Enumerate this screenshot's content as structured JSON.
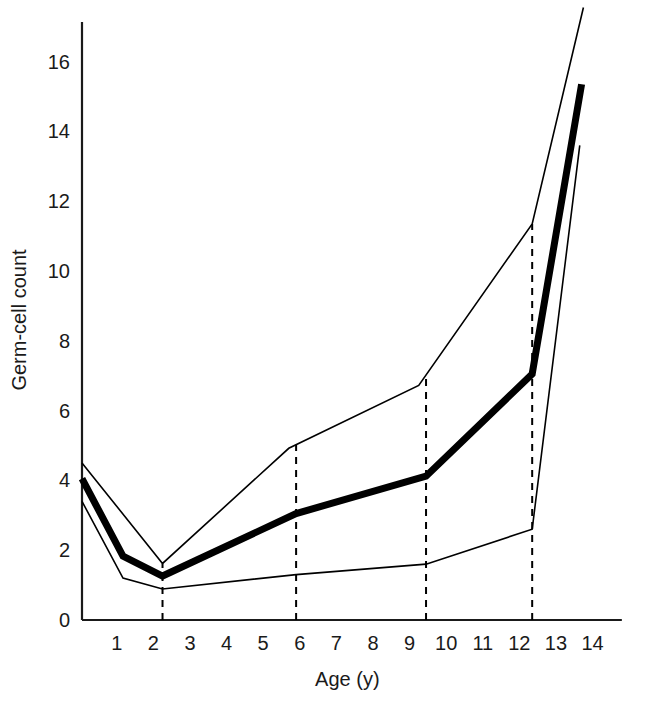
{
  "chart_data": {
    "type": "line",
    "title": "",
    "xlabel": "Age (y)",
    "ylabel": "Germ-cell count",
    "xlim": [
      0.05,
      14.6
    ],
    "ylim": [
      0,
      17.4
    ],
    "grid": false,
    "legend": null,
    "x_ticks": [
      1,
      2,
      3,
      4,
      5,
      6,
      7,
      8,
      9,
      10,
      11,
      12,
      13,
      14
    ],
    "y_ticks": [
      0,
      2,
      4,
      6,
      8,
      10,
      12,
      14,
      16
    ],
    "series": [
      {
        "name": "median",
        "style": "thick-solid",
        "color": "#000000",
        "width": 7,
        "points": [
          [
            0.05,
            4.05
          ],
          [
            1.17,
            1.83
          ],
          [
            2.25,
            1.26
          ],
          [
            5.9,
            3.05
          ],
          [
            9.45,
            4.12
          ],
          [
            12.35,
            7.05
          ],
          [
            13.7,
            15.35
          ]
        ]
      },
      {
        "name": "upper-bound",
        "style": "thin-solid",
        "color": "#000000",
        "width": 1.6,
        "points": [
          [
            0.05,
            4.5
          ],
          [
            2.25,
            1.62
          ],
          [
            5.7,
            4.92
          ],
          [
            9.25,
            6.72
          ],
          [
            12.35,
            11.35
          ],
          [
            13.75,
            17.55
          ]
        ]
      },
      {
        "name": "lower-bound",
        "style": "thin-solid",
        "color": "#000000",
        "width": 1.6,
        "points": [
          [
            0.05,
            3.4
          ],
          [
            1.17,
            1.2
          ],
          [
            2.25,
            0.89
          ],
          [
            5.9,
            1.3
          ],
          [
            9.45,
            1.6
          ],
          [
            12.35,
            2.6
          ],
          [
            13.65,
            13.6
          ]
        ]
      }
    ],
    "reference_lines": [
      {
        "name": "ref-age-2",
        "x": 2.25,
        "style": "dashed",
        "color": "#000000"
      },
      {
        "name": "ref-age-6",
        "x": 5.9,
        "style": "dashed",
        "color": "#000000"
      },
      {
        "name": "ref-age-9",
        "x": 9.45,
        "style": "dashed",
        "color": "#000000"
      },
      {
        "name": "ref-age-12",
        "x": 12.35,
        "style": "dashed",
        "color": "#000000"
      }
    ]
  },
  "axis": {
    "x_title": "Age (y)",
    "y_title": "Germ-cell count",
    "x_tick_labels": [
      "1",
      "2",
      "3",
      "4",
      "5",
      "6",
      "7",
      "8",
      "9",
      "10",
      "11",
      "12",
      "13",
      "14"
    ],
    "y_tick_labels": [
      "0",
      "2",
      "4",
      "6",
      "8",
      "10",
      "12",
      "14",
      "16"
    ]
  },
  "colors": {
    "axis": "#1a1a1a",
    "line": "#000000",
    "background": "#ffffff"
  }
}
